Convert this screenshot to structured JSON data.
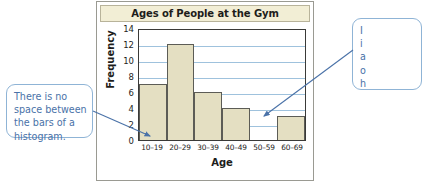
{
  "chart_data": {
    "type": "bar",
    "title": "Ages of People at the Gym",
    "xlabel": "Age",
    "ylabel": "Frequency",
    "categories": [
      "10–19",
      "20–29",
      "30–39",
      "40–49",
      "50–59",
      "60–69"
    ],
    "values": [
      7,
      12,
      6,
      4,
      0,
      3
    ],
    "ylim": [
      0,
      14
    ],
    "yticks": [
      0,
      2,
      4,
      6,
      8,
      10,
      12,
      14
    ],
    "grid": "horizontal",
    "legend": "none",
    "bar_fill_color": "#e4dfc2",
    "bar_border_color": "#5c5c56",
    "gridline_color": "#9fc2dd",
    "title_bar_color": "#f2eed5"
  },
  "annotations": {
    "accent_color": "#4a72a8",
    "left_callout": {
      "name": "no-space-between-bars-note",
      "lines": [
        "There is no",
        "space between",
        "the bars of a",
        "histogram."
      ]
    },
    "right_callout": {
      "name": "histogram-gap-note",
      "lines": [
        "I",
        "i",
        "a",
        "o",
        "h"
      ]
    }
  }
}
